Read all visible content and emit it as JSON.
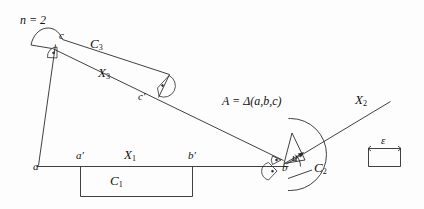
{
  "figure": {
    "caption_note": "n = 2",
    "stroke_color": "#2b2b2b",
    "background_color": "#fdfdfd",
    "text_color": "#111111"
  },
  "labels": {
    "n_equals": "n = 2",
    "vertex_c": "c",
    "vertex_c_prime": "c′",
    "vertex_a": "a",
    "vertex_a_prime": "a′",
    "vertex_b": "b",
    "vertex_b_prime": "b′",
    "set_C1": "C",
    "set_C1_sub": "1",
    "set_C2": "C",
    "set_C2_sub": "2",
    "set_C3": "C",
    "set_C3_sub": "3",
    "seg_X1": "X",
    "seg_X1_sub": "1",
    "seg_X2": "X",
    "seg_X2_sub": "2",
    "seg_X3": "X",
    "seg_X3_sub": "3",
    "angle_u": "u",
    "area_formula": "A = Δ(a,b,c)",
    "epsilon": "ε"
  },
  "icons": {
    "right_angle_marker": "right-angle-dot-icon",
    "scale_bar": "epsilon-scale-bar-icon",
    "angle_arrow": "angle-arrow-icon"
  }
}
